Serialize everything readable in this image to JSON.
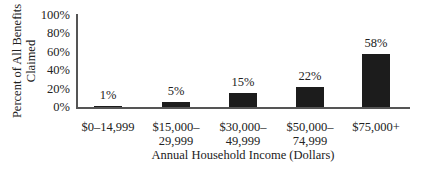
{
  "chart_data": {
    "type": "bar",
    "title": "",
    "xlabel": "Annual Household Income (Dollars)",
    "ylabel": "Percent of All Benefits Claimed",
    "ylabel_lines": [
      "Percent of All Benefits",
      "Claimed"
    ],
    "ylim": [
      0,
      100
    ],
    "yticks": [
      "0%",
      "20%",
      "40%",
      "60%",
      "80%",
      "100%"
    ],
    "grid": false,
    "legend": null,
    "categories": [
      "$0–14,999",
      "$15,000–\n29,999",
      "$30,000–\n49,999",
      "$50,000–\n74,999",
      "$75,000+"
    ],
    "values": [
      1,
      5,
      15,
      22,
      58
    ],
    "value_labels": [
      "1%",
      "5%",
      "15%",
      "22%",
      "58%"
    ],
    "bar_color": "#1c1c1c"
  }
}
